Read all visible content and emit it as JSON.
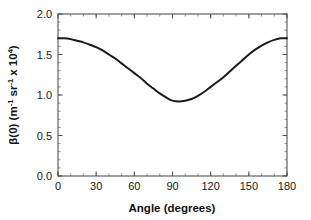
{
  "chart_data": {
    "type": "line",
    "title": "",
    "xlabel": "Angle (degrees)",
    "ylabel": "β(0) (m⁻¹ sr⁻¹ x 10⁴)",
    "ylabel_parts": {
      "symbol": "β(0)",
      "unit_open": " (m",
      "exp1": "-1",
      "unit_mid": " sr",
      "exp2": "-1",
      "unit_factor": " x 10",
      "exp3": "4",
      "unit_close": ")"
    },
    "xlim": [
      0,
      180
    ],
    "ylim": [
      0.0,
      2.0
    ],
    "xticks": [
      0,
      30,
      60,
      90,
      120,
      150,
      180
    ],
    "xtick_labels": [
      "0",
      "30",
      "60",
      "90",
      "120",
      "150",
      "180"
    ],
    "yticks": [
      0.0,
      0.5,
      1.0,
      1.5,
      2.0
    ],
    "ytick_labels": [
      "0.0",
      "0.5",
      "1.0",
      "1.5",
      "2.0"
    ],
    "x_minor_tick_interval": 10,
    "y_minor_tick_interval": 0.1,
    "grid": false,
    "legend": null,
    "line_color": "#1a1a1a",
    "line_width": 2.0,
    "frame_color": "#555555",
    "background_color": "#ffffff",
    "x": [
      0,
      5,
      10,
      15,
      20,
      25,
      30,
      35,
      40,
      45,
      50,
      55,
      60,
      65,
      70,
      75,
      80,
      85,
      90,
      95,
      100,
      105,
      110,
      115,
      120,
      125,
      130,
      135,
      140,
      145,
      150,
      155,
      160,
      165,
      170,
      175,
      180
    ],
    "values": [
      1.7,
      1.7,
      1.69,
      1.67,
      1.65,
      1.62,
      1.59,
      1.55,
      1.5,
      1.45,
      1.39,
      1.33,
      1.27,
      1.21,
      1.14,
      1.08,
      1.02,
      0.97,
      0.93,
      0.92,
      0.93,
      0.95,
      0.99,
      1.04,
      1.1,
      1.16,
      1.22,
      1.29,
      1.36,
      1.43,
      1.5,
      1.56,
      1.61,
      1.65,
      1.68,
      1.7,
      1.7
    ],
    "series_name": "beta(0) angular distribution",
    "min_point": {
      "x": 92,
      "y": 0.92
    },
    "max_points": [
      {
        "x": 0,
        "y": 1.7
      },
      {
        "x": 180,
        "y": 1.7
      }
    ]
  }
}
